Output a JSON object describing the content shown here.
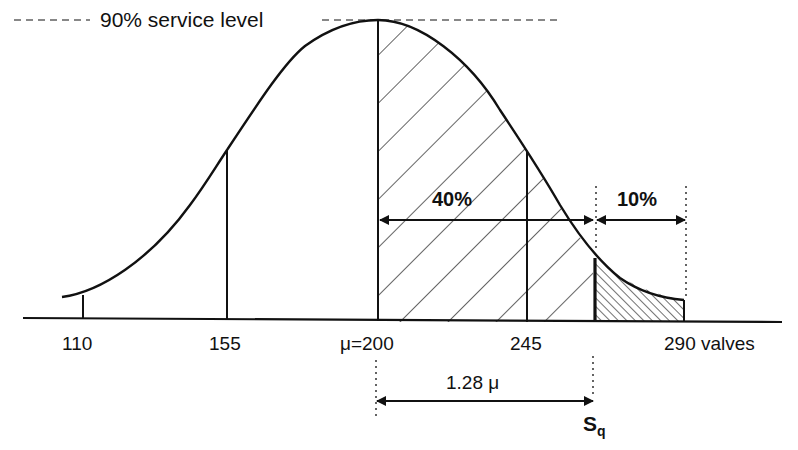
{
  "diagram": {
    "type": "normal-distribution-safety-stock",
    "title_label": "90% service level",
    "region_labels": {
      "middle": "40%",
      "tail": "10%"
    },
    "x_axis": {
      "ticks": [
        {
          "value": "110",
          "label": "110"
        },
        {
          "value": "155",
          "label": "155"
        },
        {
          "value": "200",
          "label": "μ=200"
        },
        {
          "value": "245",
          "label": "245"
        },
        {
          "value": "290",
          "label": "290 valves"
        }
      ]
    },
    "distance_label": "1.28 μ",
    "reorder_point_label": {
      "main": "S",
      "subscript": "q"
    },
    "colors": {
      "ink": "#111111",
      "background": "#ffffff"
    }
  }
}
